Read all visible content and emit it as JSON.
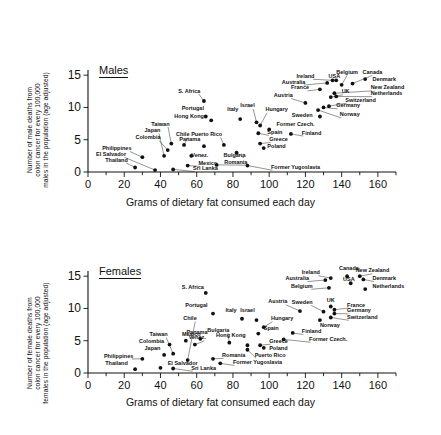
{
  "figure": {
    "xaxis_title": "Grams of dietary fat consumed each day",
    "x_ticks": [
      "0",
      "20",
      "40",
      "60",
      "80",
      "100",
      "120",
      "140",
      "160"
    ],
    "y_ticks": [
      "0",
      "5",
      "10",
      "15"
    ]
  },
  "males": {
    "panel_label": "Males",
    "ylabel_lines": [
      "Number of male deaths from",
      "colon cancer for every 100,000",
      "males in the population (age adjusted)"
    ]
  },
  "females": {
    "panel_label": "Females",
    "ylabel_lines": [
      "Number of female deaths from",
      "colon cancer for every 100,000",
      "females in the population (age adjusted)"
    ]
  },
  "chart_data": [
    {
      "type": "scatter",
      "title": "Males",
      "xlabel": "Grams of dietary fat consumed each day",
      "ylabel": "Number of male deaths from colon cancer for every 100,000 males in the population (age adjusted)",
      "xlim": [
        0,
        170
      ],
      "ylim": [
        0,
        15.8
      ],
      "xticks": [
        0,
        20,
        40,
        60,
        80,
        100,
        120,
        140,
        160
      ],
      "yticks": [
        0,
        5,
        10,
        15
      ],
      "grid": false,
      "legend": "none",
      "points": [
        {
          "label": "Thailand",
          "x": 26,
          "y": 0.7,
          "lx": 22,
          "ly": 1.6,
          "anchor": "end"
        },
        {
          "label": "El Salvador",
          "x": 37,
          "y": 0.3,
          "lx": 21,
          "ly": 2.5,
          "anchor": "end"
        },
        {
          "label": "Philippines",
          "x": 30,
          "y": 2.3,
          "lx": 24,
          "ly": 3.4,
          "anchor": "end"
        },
        {
          "label": "Sri Lanka",
          "x": 47,
          "y": 0.4,
          "lx": 58,
          "ly": 0.3,
          "anchor": "start"
        },
        {
          "label": "Colombia",
          "x": 44,
          "y": 3.4,
          "lx": 40,
          "ly": 5.1,
          "anchor": "end"
        },
        {
          "label": "Japan",
          "x": 42,
          "y": 2.5,
          "lx": 40,
          "ly": 6.2,
          "anchor": "end"
        },
        {
          "label": "Taiwan",
          "x": 46,
          "y": 4.4,
          "lx": 45,
          "ly": 7.2,
          "anchor": "end"
        },
        {
          "label": "Chile",
          "x": 53,
          "y": 4.2,
          "lx": 56,
          "ly": 5.6,
          "anchor": "end"
        },
        {
          "label": "Venez.",
          "x": 57,
          "y": 2.5,
          "lx": 57,
          "ly": 2.3,
          "anchor": "start"
        },
        {
          "label": "Mexico",
          "x": 55,
          "y": 1.0,
          "lx": 61,
          "ly": 1.1,
          "anchor": "start"
        },
        {
          "label": "Panama",
          "x": 64,
          "y": 4.0,
          "lx": 62,
          "ly": 4.8,
          "anchor": "end"
        },
        {
          "label": "Hong Kong",
          "x": 68,
          "y": 8.0,
          "lx": 64,
          "ly": 8.4,
          "anchor": "end"
        },
        {
          "label": "Portugal",
          "x": 65,
          "y": 8.6,
          "lx": 64,
          "ly": 9.6,
          "anchor": "end"
        },
        {
          "label": "S. Africa",
          "x": 64,
          "y": 11.0,
          "lx": 62,
          "ly": 12.3,
          "anchor": "end"
        },
        {
          "label": "Italy",
          "x": 84,
          "y": 8.2,
          "lx": 83,
          "ly": 9.5,
          "anchor": "end"
        },
        {
          "label": "Puerto Rico",
          "x": 75,
          "y": 4.2,
          "lx": 74,
          "ly": 5.6,
          "anchor": "end"
        },
        {
          "label": "Bulgaria",
          "x": 82,
          "y": 3.0,
          "lx": 87,
          "ly": 2.4,
          "anchor": "end"
        },
        {
          "label": "Romania",
          "x": 71,
          "y": 1.1,
          "lx": 88,
          "ly": 1.3,
          "anchor": "end"
        },
        {
          "label": "Former Yugoslavia",
          "x": 88,
          "y": 1.0,
          "lx": 101,
          "ly": 0.5,
          "anchor": "start"
        },
        {
          "label": "Israel",
          "x": 93,
          "y": 7.7,
          "lx": 92,
          "ly": 10.0,
          "anchor": "end"
        },
        {
          "label": "Hungary",
          "x": 95,
          "y": 7.2,
          "lx": 98,
          "ly": 9.4,
          "anchor": "start"
        },
        {
          "label": "Spain",
          "x": 94,
          "y": 6.0,
          "lx": 99,
          "ly": 5.9,
          "anchor": "start"
        },
        {
          "label": "Greece",
          "x": 95,
          "y": 4.4,
          "lx": 100,
          "ly": 4.8,
          "anchor": "start"
        },
        {
          "label": "Poland",
          "x": 97,
          "y": 3.7,
          "lx": 99,
          "ly": 3.7,
          "anchor": "start"
        },
        {
          "label": "Former Czech.",
          "x": 100,
          "y": 6.6,
          "lx": 104,
          "ly": 7.1,
          "anchor": "start"
        },
        {
          "label": "Austria",
          "x": 120,
          "y": 10.7,
          "lx": 113,
          "ly": 11.6,
          "anchor": "end"
        },
        {
          "label": "Sweden",
          "x": 128,
          "y": 8.6,
          "lx": 124,
          "ly": 8.5,
          "anchor": "end"
        },
        {
          "label": "Finland",
          "x": 112,
          "y": 5.9,
          "lx": 118,
          "ly": 5.8,
          "anchor": "start"
        },
        {
          "label": "France",
          "x": 128,
          "y": 12.8,
          "lx": 122,
          "ly": 12.8,
          "anchor": "end"
        },
        {
          "label": "Australia",
          "x": 132,
          "y": 13.8,
          "lx": 120,
          "ly": 13.7,
          "anchor": "end"
        },
        {
          "label": "Ireland",
          "x": 135,
          "y": 14.2,
          "lx": 125,
          "ly": 14.6,
          "anchor": "end"
        },
        {
          "label": "USA",
          "x": 137,
          "y": 14.2,
          "lx": 136,
          "ly": 14.6,
          "anchor": "middle"
        },
        {
          "label": "Belgium",
          "x": 140,
          "y": 13.5,
          "lx": 143,
          "ly": 15.2,
          "anchor": "middle"
        },
        {
          "label": "Canada",
          "x": 146,
          "y": 13.7,
          "lx": 157,
          "ly": 15.2,
          "anchor": "middle"
        },
        {
          "label": "Denmark",
          "x": 153,
          "y": 14.4,
          "lx": 157,
          "ly": 14.1,
          "anchor": "start"
        },
        {
          "label": "New Zealand",
          "x": 136,
          "y": 12.2,
          "lx": 156,
          "ly": 12.8,
          "anchor": "start"
        },
        {
          "label": "Netherlands",
          "x": 137,
          "y": 11.7,
          "lx": 156,
          "ly": 11.9,
          "anchor": "start"
        },
        {
          "label": "UK",
          "x": 134,
          "y": 11.6,
          "lx": 140,
          "ly": 12.2,
          "anchor": "start"
        },
        {
          "label": "Switzerland",
          "x": 133,
          "y": 10.2,
          "lx": 142,
          "ly": 10.9,
          "anchor": "start"
        },
        {
          "label": "Germany",
          "x": 130,
          "y": 10.0,
          "lx": 137,
          "ly": 10.0,
          "anchor": "start"
        },
        {
          "label": "Norway",
          "x": 127,
          "y": 9.6,
          "lx": 139,
          "ly": 8.6,
          "anchor": "start"
        }
      ]
    },
    {
      "type": "scatter",
      "title": "Females",
      "xlabel": "Grams of dietary fat consumed each day",
      "ylabel": "Number of female deaths from colon cancer for every 100,000 females in the population (age adjusted)",
      "xlim": [
        0,
        170
      ],
      "ylim": [
        0,
        15.8
      ],
      "xticks": [
        0,
        20,
        40,
        60,
        80,
        100,
        120,
        140,
        160
      ],
      "yticks": [
        0,
        5,
        10,
        15
      ],
      "grid": false,
      "legend": "none",
      "points": [
        {
          "label": "Thailand",
          "x": 26,
          "y": 0.6,
          "lx": 22,
          "ly": 1.2,
          "anchor": "end"
        },
        {
          "label": "Philippines",
          "x": 30,
          "y": 2.2,
          "lx": 25,
          "ly": 2.4,
          "anchor": "end"
        },
        {
          "label": "Japan",
          "x": 42,
          "y": 2.8,
          "lx": 40,
          "ly": 3.5,
          "anchor": "end"
        },
        {
          "label": "El Salvador",
          "x": 40,
          "y": 0.8,
          "lx": 44,
          "ly": 1.3,
          "anchor": "start"
        },
        {
          "label": "Sri Lanka",
          "x": 47,
          "y": 0.7,
          "lx": 57,
          "ly": 0.5,
          "anchor": "start"
        },
        {
          "label": "Colombia",
          "x": 45,
          "y": 4.4,
          "lx": 42,
          "ly": 4.6,
          "anchor": "end"
        },
        {
          "label": "Taiwan",
          "x": 47,
          "y": 3.0,
          "lx": 44,
          "ly": 5.7,
          "anchor": "end"
        },
        {
          "label": "Mexico",
          "x": 54,
          "y": 5.0,
          "lx": 57,
          "ly": 5.8,
          "anchor": "middle"
        },
        {
          "label": "Chile",
          "x": 55,
          "y": 2.0,
          "lx": 60,
          "ly": 8.2,
          "anchor": "end"
        },
        {
          "label": "Venez.",
          "x": 59,
          "y": 4.4,
          "lx": 65,
          "ly": 5.2,
          "anchor": "end"
        },
        {
          "label": "Panama",
          "x": 62,
          "y": 5.3,
          "lx": 66,
          "ly": 6.1,
          "anchor": "end"
        },
        {
          "label": "Portugal",
          "x": 69,
          "y": 9.2,
          "lx": 66,
          "ly": 10.3,
          "anchor": "end"
        },
        {
          "label": "S. Africa",
          "x": 65,
          "y": 12.4,
          "lx": 64,
          "ly": 13.0,
          "anchor": "end"
        },
        {
          "label": "Romania",
          "x": 69,
          "y": 2.2,
          "lx": 74,
          "ly": 2.5,
          "anchor": "start"
        },
        {
          "label": "Former Yugoslavia",
          "x": 73,
          "y": 1.5,
          "lx": 80,
          "ly": 1.4,
          "anchor": "start"
        },
        {
          "label": "Italy",
          "x": 85,
          "y": 8.4,
          "lx": 82,
          "ly": 9.5,
          "anchor": "end"
        },
        {
          "label": "Bulgaria",
          "x": 78,
          "y": 4.7,
          "lx": 78,
          "ly": 6.4,
          "anchor": "end"
        },
        {
          "label": "Hong Kong",
          "x": 88,
          "y": 4.3,
          "lx": 87,
          "ly": 5.5,
          "anchor": "end"
        },
        {
          "label": "Puerto Rico",
          "x": 88,
          "y": 3.6,
          "lx": 92,
          "ly": 2.5,
          "anchor": "start"
        },
        {
          "label": "Israel",
          "x": 93,
          "y": 8.2,
          "lx": 92,
          "ly": 9.5,
          "anchor": "end"
        },
        {
          "label": "Spain",
          "x": 94,
          "y": 6.1,
          "lx": 97,
          "ly": 6.6,
          "anchor": "start"
        },
        {
          "label": "Hungary",
          "x": 97,
          "y": 7.1,
          "lx": 101,
          "ly": 8.2,
          "anchor": "start"
        },
        {
          "label": "Greece",
          "x": 95,
          "y": 4.3,
          "lx": 100,
          "ly": 4.7,
          "anchor": "start"
        },
        {
          "label": "Poland",
          "x": 97,
          "y": 3.9,
          "lx": 100,
          "ly": 3.6,
          "anchor": "start"
        },
        {
          "label": "Austria",
          "x": 117,
          "y": 9.6,
          "lx": 110,
          "ly": 10.8,
          "anchor": "end"
        },
        {
          "label": "Finland",
          "x": 113,
          "y": 6.2,
          "lx": 118,
          "ly": 6.2,
          "anchor": "start"
        },
        {
          "label": "Former Czech.",
          "x": 108,
          "y": 5.2,
          "lx": 122,
          "ly": 5.0,
          "anchor": "start"
        },
        {
          "label": "Sweden",
          "x": 130,
          "y": 9.5,
          "lx": 124,
          "ly": 10.7,
          "anchor": "end"
        },
        {
          "label": "Norway",
          "x": 128,
          "y": 8.2,
          "lx": 128,
          "ly": 7.1,
          "anchor": "start"
        },
        {
          "label": "Belgium",
          "x": 133,
          "y": 13.2,
          "lx": 124,
          "ly": 13.2,
          "anchor": "end"
        },
        {
          "label": "Australia",
          "x": 131,
          "y": 14.4,
          "lx": 122,
          "ly": 14.4,
          "anchor": "end"
        },
        {
          "label": "Ireland",
          "x": 134,
          "y": 14.7,
          "lx": 128,
          "ly": 15.3,
          "anchor": "end"
        },
        {
          "label": "UK",
          "x": 134,
          "y": 10.3,
          "lx": 134,
          "ly": 11.0,
          "anchor": "middle"
        },
        {
          "label": "USA",
          "x": 145,
          "y": 13.9,
          "lx": 144,
          "ly": 14.3,
          "anchor": "middle"
        },
        {
          "label": "Canada",
          "x": 143,
          "y": 15.0,
          "lx": 144,
          "ly": 15.9,
          "anchor": "middle"
        },
        {
          "label": "New Zealand",
          "x": 150,
          "y": 15.0,
          "lx": 157,
          "ly": 15.6,
          "anchor": "middle"
        },
        {
          "label": "Denmark",
          "x": 152,
          "y": 14.5,
          "lx": 157,
          "ly": 14.4,
          "anchor": "start"
        },
        {
          "label": "Netherlands",
          "x": 153,
          "y": 13.0,
          "lx": 157,
          "ly": 13.1,
          "anchor": "start"
        },
        {
          "label": "France",
          "x": 136,
          "y": 9.8,
          "lx": 143,
          "ly": 10.3,
          "anchor": "start"
        },
        {
          "label": "Germany",
          "x": 136,
          "y": 9.2,
          "lx": 143,
          "ly": 9.4,
          "anchor": "start"
        },
        {
          "label": "Switzerland",
          "x": 134,
          "y": 8.6,
          "lx": 143,
          "ly": 8.4,
          "anchor": "start"
        }
      ]
    }
  ]
}
